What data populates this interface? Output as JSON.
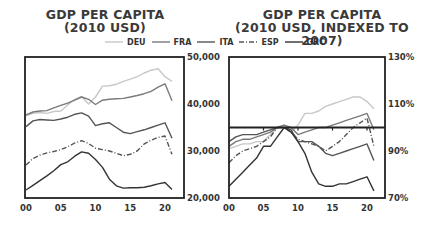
{
  "chart_data": [
    {
      "type": "line",
      "title": "GDP PER CAPITA\n(2010 USD)",
      "title_lines": [
        "GDP PER CAPITA",
        "(2010 USD)"
      ],
      "xlabel": "",
      "ylabel": "",
      "x_ticks": [
        "00",
        "05",
        "10",
        "15",
        "20"
      ],
      "y_ticks": [
        "50,000",
        "40,000",
        "30,000",
        "20,000"
      ],
      "ylim": [
        20000,
        50000
      ],
      "y_axis_position": "right",
      "grid": false,
      "x": [
        2000,
        2001,
        2002,
        2003,
        2004,
        2005,
        2006,
        2007,
        2008,
        2009,
        2010,
        2011,
        2012,
        2013,
        2014,
        2015,
        2016,
        2017,
        2018,
        2019,
        2020,
        2021
      ],
      "series": [
        {
          "name": "DEU",
          "color": "#c8c8c8",
          "style": "solid",
          "values": [
            37500,
            38000,
            38200,
            38000,
            38400,
            38500,
            39800,
            41000,
            41600,
            40000,
            41500,
            43800,
            43900,
            44200,
            44800,
            45300,
            45800,
            46600,
            47200,
            47500,
            45800,
            44800
          ]
        },
        {
          "name": "FRA",
          "color": "#7a7a7a",
          "style": "solid",
          "values": [
            37700,
            38300,
            38500,
            38600,
            39200,
            39700,
            40200,
            40800,
            41500,
            41000,
            39900,
            40800,
            41000,
            41100,
            41200,
            41500,
            41800,
            42200,
            42700,
            43600,
            44300,
            40700
          ]
        },
        {
          "name": "ITA",
          "color": "#555555",
          "style": "solid",
          "values": [
            35200,
            36400,
            36700,
            36600,
            36500,
            36800,
            37200,
            37800,
            38100,
            37400,
            35400,
            35800,
            36000,
            35000,
            34000,
            33700,
            34100,
            34500,
            35000,
            35500,
            36000,
            32700
          ]
        },
        {
          "name": "ESP",
          "color": "#555555",
          "style": "dashdot",
          "values": [
            27000,
            28400,
            29100,
            29600,
            29900,
            30300,
            30900,
            31700,
            32200,
            31600,
            30600,
            30300,
            30000,
            29500,
            29000,
            29300,
            30000,
            31500,
            32300,
            32900,
            33200,
            29300
          ]
        },
        {
          "name": "GRC",
          "color": "#333333",
          "style": "solid",
          "values": [
            21700,
            22700,
            23700,
            24700,
            25800,
            27100,
            27700,
            28900,
            29800,
            29500,
            28200,
            26500,
            24000,
            22600,
            22100,
            22200,
            22200,
            22300,
            22600,
            23000,
            23300,
            21800
          ]
        }
      ]
    },
    {
      "type": "line",
      "title": "GDP PER CAPITA\n(2010 USD, INDEXED TO 2007)",
      "title_lines": [
        "GDP PER CAPITA",
        "(2010 USD, INDEXED TO 2007)"
      ],
      "xlabel": "",
      "ylabel": "",
      "x_ticks": [
        "00",
        "05",
        "10",
        "15",
        "20"
      ],
      "y_ticks": [
        "130%",
        "110%",
        "90%",
        "70%"
      ],
      "ylim": [
        70,
        130
      ],
      "y_axis_position": "right",
      "reference_line": 100,
      "grid": false,
      "x": [
        2000,
        2001,
        2002,
        2003,
        2004,
        2005,
        2006,
        2007,
        2008,
        2009,
        2010,
        2011,
        2012,
        2013,
        2014,
        2015,
        2016,
        2017,
        2018,
        2019,
        2020,
        2021
      ],
      "series": [
        {
          "name": "DEU",
          "color": "#c8c8c8",
          "style": "solid",
          "values": [
            91,
            92,
            93,
            93,
            94,
            94,
            97,
            100,
            101,
            98,
            101,
            106,
            106,
            107,
            109,
            110,
            111,
            112,
            113,
            113,
            111,
            108
          ]
        },
        {
          "name": "FRA",
          "color": "#7a7a7a",
          "style": "solid",
          "values": [
            92,
            94,
            95,
            95,
            96,
            97,
            98,
            100,
            101,
            100,
            97,
            98,
            99,
            100,
            100,
            101,
            102,
            103,
            104,
            105,
            106,
            99
          ]
        },
        {
          "name": "ITA",
          "color": "#555555",
          "style": "solid",
          "values": [
            94,
            96,
            97,
            97,
            97,
            98,
            99,
            100,
            100,
            99,
            94,
            94,
            94,
            92,
            89,
            88,
            89,
            90,
            91,
            92,
            93,
            86
          ]
        },
        {
          "name": "ESP",
          "color": "#555555",
          "style": "dashdot",
          "values": [
            85,
            88,
            90,
            91,
            92,
            94,
            96,
            100,
            100,
            98,
            95,
            94,
            93,
            92,
            90,
            92,
            94,
            97,
            100,
            102,
            104,
            92
          ]
        },
        {
          "name": "GRC",
          "color": "#333333",
          "style": "solid",
          "values": [
            75,
            78,
            81,
            84,
            87,
            92,
            92,
            96,
            100,
            98,
            94,
            89,
            81,
            76,
            75,
            75,
            76,
            76,
            77,
            78,
            79,
            73
          ]
        }
      ]
    }
  ],
  "titles": {
    "left_line1": "GDP PER CAPITA",
    "left_line2": "(2010 USD)",
    "right_line1": "GDP PER CAPITA",
    "right_line2": "(2010 USD, INDEXED TO 2007)"
  },
  "legend": [
    {
      "label": "DEU",
      "color": "#c8c8c8",
      "style": "solid"
    },
    {
      "label": "FRA",
      "color": "#7a7a7a",
      "style": "solid"
    },
    {
      "label": "ITA",
      "color": "#555555",
      "style": "solid"
    },
    {
      "label": "ESP",
      "color": "#555555",
      "style": "dashdot"
    },
    {
      "label": "GRC",
      "color": "#333333",
      "style": "solid"
    }
  ]
}
